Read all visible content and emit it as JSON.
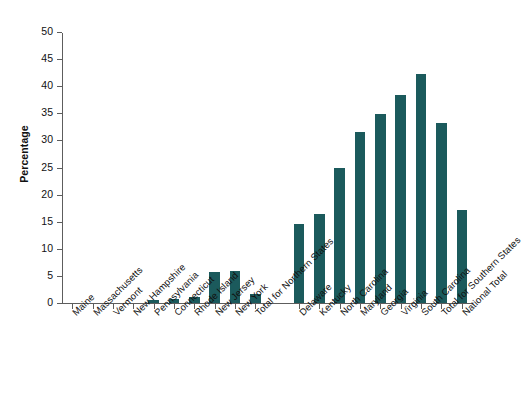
{
  "chart_data": {
    "type": "bar",
    "title": "",
    "xlabel": "",
    "ylabel": "Percentage",
    "ylim": [
      0,
      50
    ],
    "ytick_values": [
      0,
      5,
      10,
      15,
      20,
      25,
      30,
      35,
      40,
      45,
      50
    ],
    "ytick_labels": [
      "0",
      "5",
      "10",
      "15",
      "20",
      "25",
      "30",
      "35",
      "40",
      "45",
      "50"
    ],
    "grid": false,
    "legend": "none",
    "bar_color": "#1b5a5c",
    "axis_color": "#5d5d5d",
    "categories": [
      "Maine",
      "Massachusetts",
      "Vermont",
      "New Hampshire",
      "Pennsylvania",
      "Connecticut",
      "Rhode Island",
      "New Jersey",
      "New York",
      "Total for Northern States",
      "Delaware",
      "Kentucky",
      "North Carolina",
      "Maryland",
      "Georgia",
      "Virginia",
      "South Carolina",
      "Total for Southern States",
      "National Total"
    ],
    "values": [
      0.0,
      0.0,
      0.0,
      0.0,
      0.5,
      0.8,
      1.1,
      5.8,
      5.9,
      1.7,
      14.6,
      16.4,
      24.9,
      31.6,
      34.8,
      38.4,
      42.3,
      33.2,
      17.1
    ],
    "group_break_after_index": 9
  }
}
